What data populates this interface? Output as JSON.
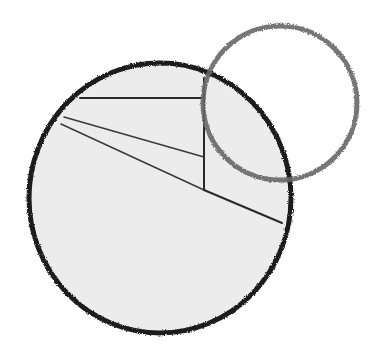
{
  "diagram": {
    "background": "#ffffff",
    "large_circle": {
      "cx": 160,
      "cy": 198,
      "rx": 131,
      "ry": 135,
      "fill": "#ececec",
      "stroke": "#1c1c1c",
      "stroke_width": 5
    },
    "small_circle": {
      "cx": 280,
      "cy": 103,
      "r": 77,
      "fill": "none",
      "stroke": "#666666",
      "stroke_width": 5
    },
    "lines": [
      {
        "name": "top-chord",
        "x1": 80,
        "y1": 98,
        "x2": 204,
        "y2": 98,
        "stroke": "#2a2a2a",
        "width": 2
      },
      {
        "name": "vertical-segment",
        "x1": 204,
        "y1": 78,
        "x2": 204,
        "y2": 190,
        "stroke": "#2a2a2a",
        "width": 2
      },
      {
        "name": "upper-diagonal",
        "x1": 64,
        "y1": 117,
        "x2": 204,
        "y2": 157,
        "stroke": "#3a3a3a",
        "width": 1.5
      },
      {
        "name": "lower-diagonal",
        "x1": 61,
        "y1": 124,
        "x2": 204,
        "y2": 190,
        "stroke": "#3a3a3a",
        "width": 1.5
      },
      {
        "name": "right-segment",
        "x1": 204,
        "y1": 190,
        "x2": 282,
        "y2": 223,
        "stroke": "#2a2a2a",
        "width": 2
      }
    ]
  }
}
